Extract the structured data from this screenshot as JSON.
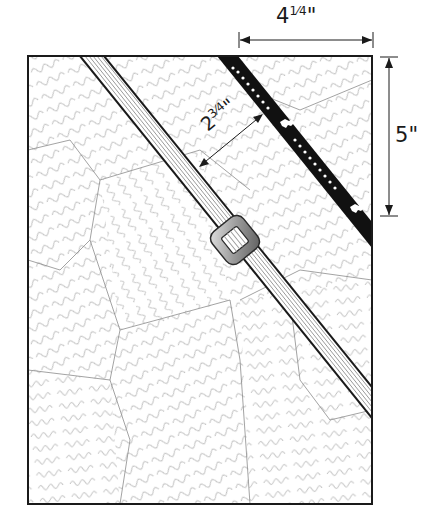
{
  "diagram": {
    "panel": {
      "x": 28,
      "y": 56,
      "width": 344,
      "height": 448,
      "background": "script-handwriting paper"
    },
    "elements": [
      {
        "name": "gray-strap",
        "description": "striped gray diagonal strap"
      },
      {
        "name": "buckle",
        "description": "gray rounded-square buckle on strap"
      },
      {
        "name": "music-ribbon",
        "description": "black ribbon with music notes and animal motifs"
      }
    ],
    "dimensions": {
      "width": {
        "whole": "4",
        "fraction": "1⁄4",
        "unit": "\""
      },
      "height": {
        "whole": "5",
        "fraction": "",
        "unit": "\""
      },
      "gap": {
        "whole": "2",
        "fraction": "3⁄4",
        "unit": "\""
      }
    },
    "colors": {
      "outline": "#1a1a1a",
      "strap_stripe": "#9a9a9a",
      "ribbon": "#111111",
      "paper": "#ffffff",
      "script": "#8a8a8a"
    }
  }
}
